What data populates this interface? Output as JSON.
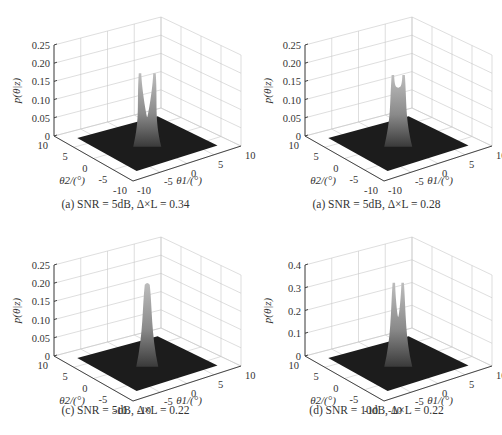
{
  "chart_data": [
    {
      "id": "a",
      "type": "surface3d",
      "caption": "(a) SNR = 5dB, Δ×L = 0.34",
      "zlabel": "p(θ|z)",
      "xlabel": "θ1/(°)",
      "ylabel": "θ2/(°)",
      "zticks": [
        "0",
        "0.05",
        "0.10",
        "0.15",
        "0.20",
        "0.25"
      ],
      "zlim": [
        0,
        0.25
      ],
      "x_ticks": [
        "-10",
        "-5",
        "0",
        "5",
        "10"
      ],
      "y_ticks": [
        "-10",
        "-5",
        "0",
        "5",
        "10"
      ],
      "xlim": [
        -10,
        10
      ],
      "ylim": [
        -10,
        10
      ],
      "peaks": [
        {
          "theta1": -0.8,
          "theta2": 0.8,
          "height": 0.19
        },
        {
          "theta1": 0.8,
          "theta2": -0.8,
          "height": 0.19
        }
      ],
      "dip_height": 0.07,
      "num_peaks": 2
    },
    {
      "id": "b",
      "type": "surface3d",
      "caption": "(a) SNR = 5dB, Δ×L = 0.28",
      "zlabel": "p(θ|z)",
      "xlabel": "θ1/(°)",
      "ylabel": "θ2/(°)",
      "zticks": [
        "0",
        "0.05",
        "0.10",
        "0.15",
        "0.20",
        "0.25"
      ],
      "zlim": [
        0,
        0.25
      ],
      "x_ticks": [
        "-10",
        "-5",
        "0",
        "5",
        "10"
      ],
      "y_ticks": [
        "-10",
        "-5",
        "0",
        "5",
        "10"
      ],
      "xlim": [
        -10,
        10
      ],
      "ylim": [
        -10,
        10
      ],
      "peaks": [
        {
          "theta1": -0.6,
          "theta2": 0.6,
          "height": 0.185
        },
        {
          "theta1": 0.6,
          "theta2": -0.6,
          "height": 0.185
        }
      ],
      "dip_height": 0.15,
      "num_peaks": 2
    },
    {
      "id": "c",
      "type": "surface3d",
      "caption": "(c) SNR = 5dB, Δ×L = 0.22",
      "zlabel": "p(θ|z)",
      "xlabel": "θ1/(°)",
      "ylabel": "θ2/(°)",
      "zticks": [
        "0",
        "0.05",
        "0.10",
        "0.15",
        "0.20",
        "0.25"
      ],
      "zlim": [
        0,
        0.25
      ],
      "x_ticks": [
        "-10",
        "-5",
        "0",
        "5",
        "10"
      ],
      "y_ticks": [
        "-10",
        "-5",
        "0",
        "5",
        "10"
      ],
      "xlim": [
        -10,
        10
      ],
      "ylim": [
        -10,
        10
      ],
      "peaks": [
        {
          "theta1": 0,
          "theta2": 0,
          "height": 0.22
        }
      ],
      "dip_height": null,
      "num_peaks": 1
    },
    {
      "id": "d",
      "type": "surface3d",
      "caption": "(d) SNR = 10dB, Δ×L = 0.22",
      "zlabel": "p(θ|z)",
      "xlabel": "θ1/(°)",
      "ylabel": "θ2/(°)",
      "zticks": [
        "0",
        "0.1",
        "0.2",
        "0.3",
        "0.4"
      ],
      "zlim": [
        0,
        0.4
      ],
      "x_ticks": [
        "-10",
        "-5",
        "0",
        "5",
        "10"
      ],
      "y_ticks": [
        "-10",
        "-5",
        "0",
        "5",
        "10"
      ],
      "xlim": [
        -10,
        10
      ],
      "ylim": [
        -10,
        10
      ],
      "peaks": [
        {
          "theta1": -0.5,
          "theta2": 0.5,
          "height": 0.35
        },
        {
          "theta1": 0.5,
          "theta2": -0.5,
          "height": 0.35
        }
      ],
      "dip_height": 0.2,
      "num_peaks": 2
    }
  ],
  "captions": {
    "a": "(a) SNR = 5dB, Δ×L = 0.34",
    "b": "(a) SNR = 5dB, Δ×L = 0.28",
    "c": "(c) SNR = 5dB, Δ×L = 0.22",
    "d": "(d) SNR = 10dB, Δ×L = 0.22"
  }
}
